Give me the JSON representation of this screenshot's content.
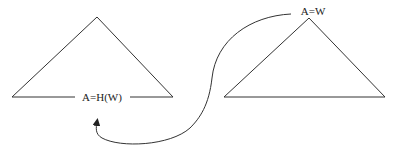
{
  "diagram": {
    "left_triangle": {
      "label": "A=H(W)"
    },
    "right_triangle": {
      "label": "A=W"
    },
    "arrow": {
      "from": "right_triangle",
      "to": "left_triangle"
    },
    "colors": {
      "line": "#333333",
      "text": "#222222",
      "background": "#ffffff"
    }
  }
}
